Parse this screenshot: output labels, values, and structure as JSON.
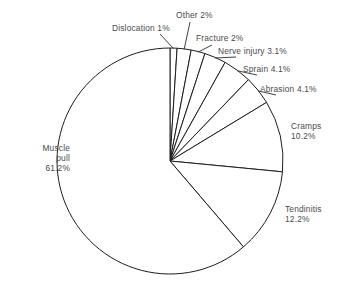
{
  "chart_data": {
    "type": "pie",
    "title": "",
    "subtitle": "",
    "xlabel": "",
    "ylabel": "",
    "legend": "none",
    "grid": false,
    "total_percent": 100.0,
    "start_angle_deg": 0,
    "direction": "clockwise",
    "categories": [
      "Dislocation",
      "Other",
      "Fracture",
      "Nerve injury",
      "Sprain",
      "Abrasion",
      "Cramps",
      "Tendinitis",
      "Muscle pull"
    ],
    "values": [
      1.0,
      2.0,
      2.0,
      3.1,
      4.1,
      4.1,
      10.2,
      12.2,
      61.2
    ],
    "slices": [
      {
        "name": "Dislocation",
        "value": 1.0,
        "label": "Dislocation 1%",
        "label_lines": [
          "Dislocation 1%"
        ]
      },
      {
        "name": "Other",
        "value": 2.0,
        "label": "Other 2%",
        "label_lines": [
          "Other 2%"
        ]
      },
      {
        "name": "Fracture",
        "value": 2.0,
        "label": "Fracture 2%",
        "label_lines": [
          "Fracture 2%"
        ]
      },
      {
        "name": "Nerve injury",
        "value": 3.1,
        "label": "Nerve injury 3.1%",
        "label_lines": [
          "Nerve injury 3.1%"
        ]
      },
      {
        "name": "Sprain",
        "value": 4.1,
        "label": "Sprain 4.1%",
        "label_lines": [
          "Sprain 4.1%"
        ]
      },
      {
        "name": "Abrasion",
        "value": 4.1,
        "label": "Abrasion 4.1%",
        "label_lines": [
          "Abrasion 4.1%"
        ]
      },
      {
        "name": "Cramps",
        "value": 10.2,
        "label": "Cramps 10.2%",
        "label_lines": [
          "Cramps",
          "10.2%"
        ]
      },
      {
        "name": "Tendinitis",
        "value": 12.2,
        "label": "Tendinitis 12.2%",
        "label_lines": [
          "Tendinitis",
          "12.2%"
        ]
      },
      {
        "name": "Muscle pull",
        "value": 61.2,
        "label": "Muscle pull 61.2%",
        "label_lines": [
          "Muscle",
          "pull",
          "61.2%"
        ]
      }
    ],
    "colors": {
      "slice_fill": "#ffffff",
      "slice_stroke": "#1d1d1d",
      "leader_line": "#2b2b2b",
      "label_text": "#4a4a4a",
      "background": "#ffffff"
    },
    "geometry": {
      "center_x": 170,
      "center_y": 161,
      "radius": 113
    }
  },
  "labels": {
    "dislocation": {
      "text": "Dislocation 1%",
      "lines": [
        "Dislocation 1%"
      ],
      "x": 112,
      "y": 23,
      "align": "left"
    },
    "other": {
      "text": "Other 2%",
      "lines": [
        "Other 2%"
      ],
      "x": 176,
      "y": 10,
      "align": "left"
    },
    "fracture": {
      "text": "Fracture 2%",
      "lines": [
        "Fracture 2%"
      ],
      "x": 196,
      "y": 33,
      "align": "left"
    },
    "nerve_injury": {
      "text": "Nerve injury 3.1%",
      "lines": [
        "Nerve injury 3.1%"
      ],
      "x": 218,
      "y": 46,
      "align": "left"
    },
    "sprain": {
      "text": "Sprain 4.1%",
      "lines": [
        "Sprain 4.1%"
      ],
      "x": 243,
      "y": 64,
      "align": "left"
    },
    "abrasion": {
      "text": "Abrasion 4.1%",
      "lines": [
        "Abrasion 4.1%"
      ],
      "x": 260,
      "y": 84,
      "align": "left"
    },
    "cramps": {
      "text": "Cramps 10.2%",
      "lines": [
        "Cramps",
        "10.2%"
      ],
      "x": 291,
      "y": 121,
      "align": "left"
    },
    "tendinitis": {
      "text": "Tendinitis 12.2%",
      "lines": [
        "Tendinitis",
        "12.2%"
      ],
      "x": 285,
      "y": 204,
      "align": "left"
    },
    "muscle_pull": {
      "text": "Muscle pull 61.2%",
      "lines": [
        "Muscle",
        "pull",
        "61.2%"
      ],
      "x": 10,
      "y": 143,
      "align": "right"
    }
  }
}
